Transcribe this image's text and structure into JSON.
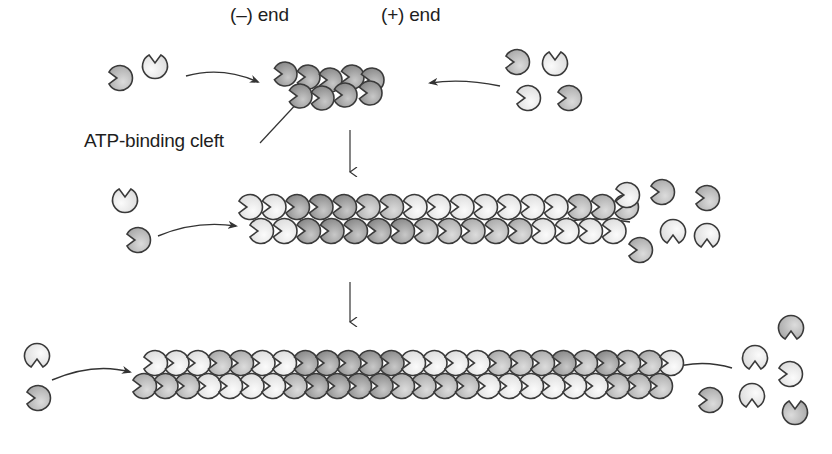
{
  "labels": {
    "minus_end": "(–) end",
    "plus_end": "(+) end",
    "atp_cleft": "ATP-binding cleft"
  },
  "colors": {
    "outline": "#3a3a3a",
    "dark": "#9a9a9a",
    "mid": "#b9b9b9",
    "light": "#e6e6e6",
    "arrow": "#333333"
  },
  "stages": [
    {
      "name": "nucleus",
      "filament": [
        {
          "x": 285,
          "y": 74,
          "s": "dark",
          "f": "L"
        },
        {
          "x": 308,
          "y": 77,
          "s": "dark",
          "f": "L"
        },
        {
          "x": 330,
          "y": 80,
          "s": "dark",
          "f": "L"
        },
        {
          "x": 352,
          "y": 77,
          "s": "dark",
          "f": "L"
        },
        {
          "x": 372,
          "y": 80,
          "s": "dark",
          "f": "L"
        },
        {
          "x": 300,
          "y": 96,
          "s": "dark",
          "f": "L"
        },
        {
          "x": 322,
          "y": 98,
          "s": "dark",
          "f": "L"
        },
        {
          "x": 345,
          "y": 95,
          "s": "dark",
          "f": "L"
        },
        {
          "x": 370,
          "y": 93,
          "s": "dark",
          "f": "L"
        }
      ],
      "free_left": [
        {
          "x": 120,
          "y": 78,
          "s": "mid",
          "f": "L"
        },
        {
          "x": 155,
          "y": 66,
          "s": "light",
          "f": "T"
        }
      ],
      "free_right": [
        {
          "x": 517,
          "y": 62,
          "s": "mid",
          "f": "L"
        },
        {
          "x": 555,
          "y": 63,
          "s": "light",
          "f": "T"
        },
        {
          "x": 528,
          "y": 98,
          "s": "light",
          "f": "R"
        },
        {
          "x": 569,
          "y": 98,
          "s": "mid",
          "f": "R"
        }
      ]
    },
    {
      "name": "elongating",
      "free_left": [
        {
          "x": 125,
          "y": 200,
          "s": "light",
          "f": "T"
        },
        {
          "x": 138,
          "y": 240,
          "s": "mid",
          "f": "R"
        }
      ],
      "free_right": [
        {
          "x": 627,
          "y": 195,
          "s": "light",
          "f": "L"
        },
        {
          "x": 662,
          "y": 192,
          "s": "mid",
          "f": "L"
        },
        {
          "x": 707,
          "y": 198,
          "s": "mid",
          "f": "L"
        },
        {
          "x": 673,
          "y": 232,
          "s": "light",
          "f": "B"
        },
        {
          "x": 707,
          "y": 236,
          "s": "light",
          "f": "B"
        },
        {
          "x": 640,
          "y": 250,
          "s": "mid",
          "f": "R"
        }
      ]
    },
    {
      "name": "filament",
      "free_left": [
        {
          "x": 37,
          "y": 356,
          "s": "light",
          "f": "B"
        },
        {
          "x": 38,
          "y": 398,
          "s": "mid",
          "f": "L"
        }
      ],
      "free_right": [
        {
          "x": 791,
          "y": 328,
          "s": "mid",
          "f": "B"
        },
        {
          "x": 755,
          "y": 358,
          "s": "light",
          "f": "B"
        },
        {
          "x": 790,
          "y": 374,
          "s": "light",
          "f": "L"
        },
        {
          "x": 752,
          "y": 396,
          "s": "light",
          "f": "B"
        },
        {
          "x": 710,
          "y": 400,
          "s": "mid",
          "f": "R"
        },
        {
          "x": 795,
          "y": 412,
          "s": "mid",
          "f": "T"
        }
      ]
    }
  ],
  "long_filaments": [
    {
      "name": "filament-2",
      "x0": 250,
      "top_y": 207,
      "bottom_y": 231,
      "step": 23.5,
      "offset": 11,
      "top_shades": [
        "light",
        "light",
        "dark",
        "dark",
        "dark",
        "mid",
        "mid",
        "light",
        "light",
        "light",
        "light",
        "light",
        "light",
        "light",
        "mid",
        "mid",
        "mid"
      ],
      "bottom_shades": [
        "light",
        "light",
        "dark",
        "dark",
        "dark",
        "dark",
        "dark",
        "mid",
        "mid",
        "mid",
        "mid",
        "mid",
        "light",
        "light",
        "light",
        "light"
      ]
    },
    {
      "name": "filament-3",
      "x0": 155,
      "top_y": 363,
      "bottom_y": 386,
      "step": 21.5,
      "offset": -11,
      "top_shades": [
        "light",
        "light",
        "light",
        "mid",
        "mid",
        "light",
        "light",
        "dark",
        "dark",
        "dark",
        "dark",
        "dark",
        "light",
        "light",
        "light",
        "light",
        "mid",
        "mid",
        "mid",
        "dark",
        "mid",
        "dark",
        "mid",
        "mid",
        "light"
      ],
      "bottom_shades": [
        "mid",
        "mid",
        "mid",
        "light",
        "light",
        "light",
        "light",
        "mid",
        "dark",
        "dark",
        "dark",
        "dark",
        "mid",
        "mid",
        "mid",
        "mid",
        "light",
        "light",
        "light",
        "light",
        "light",
        "light",
        "mid",
        "mid",
        "mid"
      ]
    }
  ],
  "arrows": [
    {
      "name": "arrow-in-left-1",
      "d": "M186,76 Q222,66 258,82"
    },
    {
      "name": "arrow-in-right-1",
      "d": "M500,86 Q462,78 430,83"
    },
    {
      "name": "arrow-in-left-2",
      "d": "M158,236 Q196,220 236,226"
    },
    {
      "name": "arrow-in-right-2",
      "d": "M630,222 Q598,216 562,222"
    },
    {
      "name": "arrow-in-left-3",
      "d": "M52,380 Q94,362 130,372"
    },
    {
      "name": "arrow-in-right-3",
      "d": "M732,368 Q700,358 664,370"
    }
  ],
  "down_arrows": [
    {
      "name": "down-arrow-1",
      "x": 350,
      "y1": 130,
      "y2": 172
    },
    {
      "name": "down-arrow-2",
      "x": 350,
      "y1": 282,
      "y2": 322
    }
  ],
  "leader_line": {
    "x1": 260,
    "y1": 143,
    "x2": 300,
    "y2": 100
  }
}
